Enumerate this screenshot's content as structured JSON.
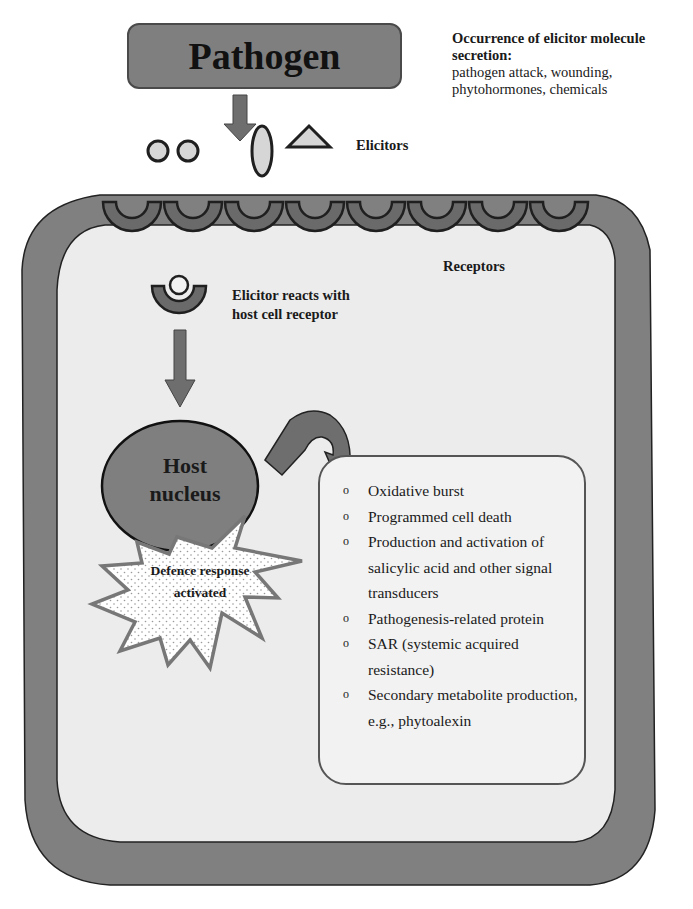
{
  "diagram": {
    "pathogen": {
      "label": "Pathogen"
    },
    "occurrence": {
      "title": "Occurrence of elicitor molecule secretion:",
      "body": "pathogen attack, wounding, phytohormones, chemicals"
    },
    "elicitors": {
      "label": "Elicitors",
      "shapes": [
        "circle",
        "circle",
        "ellipse",
        "triangle"
      ]
    },
    "receptors": {
      "label": "Receptors",
      "count": 8
    },
    "reaction": {
      "label": "Elicitor reacts with host cell receptor"
    },
    "nucleus": {
      "label": "Host nucleus"
    },
    "defence": {
      "label": "Defence response activated"
    },
    "responses": {
      "bullet": "o",
      "items": [
        "Oxidative burst",
        "Programmed cell death",
        "Production and activation of salicylic acid and other signal transducers",
        "Pathogenesis-related protein",
        "SAR (systemic acquired resistance)",
        "Secondary metabolite production, e.g., phytoalexin"
      ]
    },
    "colors": {
      "cell_wall": "#808080",
      "cytoplasm": "#ececec",
      "pathogen_box": "#7f7f7f",
      "arrow": "#6e6e6e",
      "elicitor_fill": "#d6d6d6",
      "outline": "#1f1f1f"
    }
  }
}
